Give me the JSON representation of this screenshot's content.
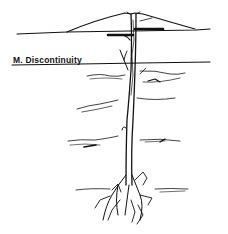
{
  "diagram": {
    "labels": {
      "discontinuity": "M. Discontinuity"
    },
    "colors": {
      "ink": "#111111",
      "background": "#ffffff"
    },
    "elements": [
      "volcano-cone",
      "surface-line",
      "discontinuity-line",
      "magma-conduit",
      "sills",
      "strata-lines",
      "root-zone"
    ]
  }
}
